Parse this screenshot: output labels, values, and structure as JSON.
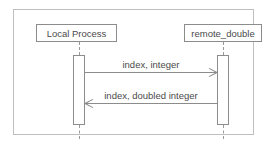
{
  "diagram": {
    "type": "uml-sequence-diagram",
    "colors": {
      "frame_border": "#bfbfbf",
      "box_border": "#8c8c8c",
      "line": "#8c8c8c",
      "lifeline": "#9a9a9a",
      "text": "#4a4a4a",
      "background": "#ffffff"
    },
    "participants": [
      {
        "id": "local",
        "label": "Local Process"
      },
      {
        "id": "remote",
        "label": "remote_double"
      }
    ],
    "messages": [
      {
        "id": "msg1",
        "label": "index, integer",
        "from": "local",
        "to": "remote",
        "direction": "right"
      },
      {
        "id": "msg2",
        "label": "index, doubled integer",
        "from": "remote",
        "to": "local",
        "direction": "left"
      }
    ]
  }
}
